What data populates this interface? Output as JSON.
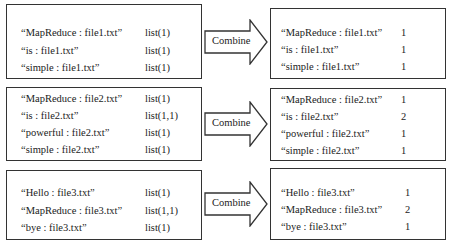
{
  "groups": [
    {
      "input": [
        {
          "key": "“MapReduce : file1.txt”",
          "value": "list(1)"
        },
        {
          "key": "“is : file1.txt”",
          "value": "list(1)"
        },
        {
          "key": "“simple : file1.txt”",
          "value": "list(1)"
        }
      ],
      "arrow_label": "Combine",
      "output": [
        {
          "key": "“MapReduce : file1.txt”",
          "value": "1"
        },
        {
          "key": "“is : file1.txt”",
          "value": "1"
        },
        {
          "key": "“simple : file1.txt”",
          "value": "1"
        }
      ]
    },
    {
      "input": [
        {
          "key": "“MapReduce : file2.txt”",
          "value": "list(1)"
        },
        {
          "key": "“is : file2.txt”",
          "value": "list(1,1)"
        },
        {
          "key": "“powerful : file2.txt”",
          "value": "list(1)"
        },
        {
          "key": "“simple : file2.txt”",
          "value": "list(1)"
        }
      ],
      "arrow_label": "Combine",
      "output": [
        {
          "key": "“MapReduce : file2.txt”",
          "value": "1"
        },
        {
          "key": "“is : file2.txt”",
          "value": "2"
        },
        {
          "key": "“powerful : file2.txt”",
          "value": "1"
        },
        {
          "key": "“simple : file2.txt”",
          "value": "1"
        }
      ]
    },
    {
      "input": [
        {
          "key": "“Hello : file3.txt”",
          "value": "list(1)"
        },
        {
          "key": "“MapReduce : file3.txt”",
          "value": "list(1,1)"
        },
        {
          "key": "“bye : file3.txt”",
          "value": "list(1)"
        }
      ],
      "arrow_label": "Combine",
      "output": [
        {
          "key": "“Hello : file3.txt”",
          "value": "1"
        },
        {
          "key": "“MapReduce : file3.txt”",
          "value": "2"
        },
        {
          "key": "“bye : file3.txt”",
          "value": "1"
        }
      ]
    }
  ]
}
